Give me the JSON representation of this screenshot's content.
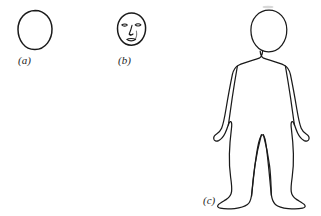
{
  "figure": {
    "background_color": "#ffffff",
    "ink_color": "#1a1a1a",
    "panels": [
      {
        "id": "a",
        "label": "(a)",
        "name": "blank-oval",
        "description": "Empty egg-shaped head outline",
        "label_x": 18,
        "label_y": 64
      },
      {
        "id": "b",
        "label": "(b)",
        "name": "face-with-features",
        "description": "Oval head with two eyes, nose and mouth",
        "label_x": 118,
        "label_y": 64
      },
      {
        "id": "c",
        "label": "(c)",
        "name": "full-body-figure",
        "description": "Standing full body outline with head, arms and legs",
        "label_x": 203,
        "label_y": 204
      }
    ]
  }
}
